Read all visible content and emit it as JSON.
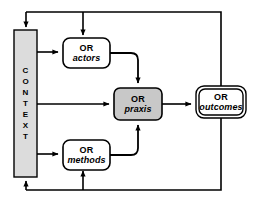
{
  "diagram": {
    "background_color": "#ffffff",
    "stroke_color": "#000000",
    "context_fill": "#dcdcdc",
    "praxis_fill": "#c8c8c8",
    "plain_fill": "#ffffff",
    "nodes": {
      "context": {
        "name": "CONTEXT",
        "letters": [
          "C",
          "O",
          "N",
          "T",
          "E",
          "X",
          "T"
        ],
        "orientation": "vertical",
        "fill": "#dcdcdc"
      },
      "actors": {
        "line1": "OR",
        "line2": "actors",
        "fill": "#ffffff"
      },
      "praxis": {
        "line1": "OR",
        "line2": "praxis",
        "fill": "#c8c8c8"
      },
      "methods": {
        "line1": "OR",
        "line2": "methods",
        "fill": "#ffffff"
      },
      "outcomes": {
        "line1": "OR",
        "line2": "outcomes",
        "fill": "#ffffff",
        "border_style": "double"
      }
    },
    "edges": [
      {
        "id": "context-to-actors",
        "from": "context",
        "to": "actors",
        "style": "straight-arrow"
      },
      {
        "id": "context-to-praxis",
        "from": "context",
        "to": "praxis",
        "style": "straight-arrow"
      },
      {
        "id": "context-to-methods",
        "from": "context",
        "to": "methods",
        "style": "straight-arrow"
      },
      {
        "id": "actors-to-praxis",
        "from": "actors",
        "to": "praxis",
        "style": "elbow-arrow"
      },
      {
        "id": "methods-to-praxis",
        "from": "methods",
        "to": "praxis",
        "style": "elbow-arrow"
      },
      {
        "id": "praxis-to-outcomes",
        "from": "praxis",
        "to": "outcomes",
        "style": "straight-arrow"
      },
      {
        "id": "outcomes-feedback-top-to-context",
        "from": "outcomes",
        "to": "context",
        "style": "feedback-top"
      },
      {
        "id": "outcomes-feedback-top-to-actors",
        "from": "outcomes",
        "to": "actors",
        "style": "feedback-top"
      },
      {
        "id": "outcomes-feedback-bottom-to-context",
        "from": "outcomes",
        "to": "context",
        "style": "feedback-bottom"
      },
      {
        "id": "outcomes-feedback-bottom-to-methods",
        "from": "outcomes",
        "to": "methods",
        "style": "feedback-bottom"
      }
    ]
  }
}
